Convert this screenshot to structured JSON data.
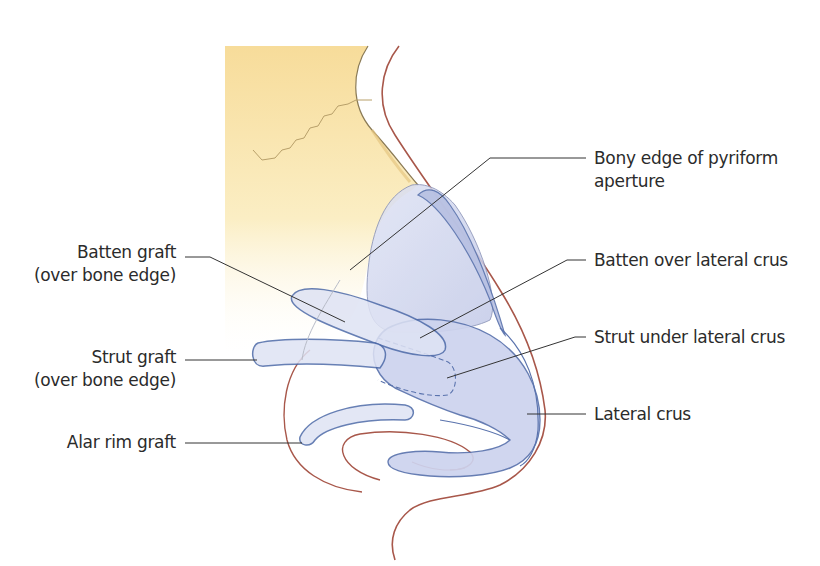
{
  "diagram": {
    "type": "anatomical illustration",
    "colors": {
      "bone": "#f8e3a8",
      "cartilage_fill": "#c9cfea",
      "cartilage_stroke": "#5a73ad",
      "skin": "#a8574a",
      "leader": "#333333"
    }
  },
  "labels": {
    "left": [
      {
        "id": "batten-graft",
        "line1": "Batten graft",
        "line2": "(over bone edge)"
      },
      {
        "id": "strut-graft",
        "line1": "Strut graft",
        "line2": "(over bone edge)"
      },
      {
        "id": "alar-rim-graft",
        "line1": "Alar rim graft",
        "line2": ""
      }
    ],
    "right": [
      {
        "id": "bony-edge",
        "line1": "Bony edge of pyriform",
        "line2": "aperture"
      },
      {
        "id": "batten-over-lateral-crus",
        "line1": "Batten over lateral crus",
        "line2": ""
      },
      {
        "id": "strut-under-lateral-crus",
        "line1": "Strut under lateral crus",
        "line2": ""
      },
      {
        "id": "lateral-crus",
        "line1": "Lateral crus",
        "line2": ""
      }
    ]
  }
}
